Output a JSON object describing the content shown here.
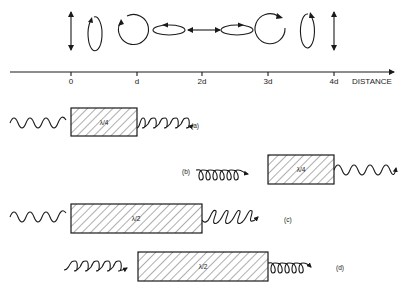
{
  "axis": {
    "label": "DISTANCE",
    "ticks": [
      "0",
      "d",
      "2d",
      "3d",
      "4d"
    ]
  },
  "polarization_states": [
    {
      "at": "0",
      "type": "linear-vertical"
    },
    {
      "at": "0.5d",
      "type": "elliptical-vertical"
    },
    {
      "at": "d",
      "type": "circular"
    },
    {
      "at": "1.5d",
      "type": "elliptical-horizontal"
    },
    {
      "at": "2d",
      "type": "linear-horizontal"
    },
    {
      "at": "2.5d",
      "type": "elliptical-horizontal"
    },
    {
      "at": "3d",
      "type": "circular"
    },
    {
      "at": "3.5d",
      "type": "elliptical-vertical"
    },
    {
      "at": "4d",
      "type": "linear-vertical"
    }
  ],
  "plates": [
    {
      "id": "a",
      "label": "(a)",
      "plate": "λ/4",
      "input": "linear",
      "output": "circular"
    },
    {
      "id": "b",
      "label": "(b)",
      "plate": "λ/4",
      "input": "circular",
      "output": "linear"
    },
    {
      "id": "c",
      "label": "(c)",
      "plate": "λ/2",
      "input": "linear",
      "output": "linear-rotated"
    },
    {
      "id": "d",
      "label": "(d)",
      "plate": "λ/2",
      "input": "circular",
      "output": "circular-reversed"
    }
  ],
  "plate_text": {
    "a": "λ/4",
    "b": "λ/4",
    "c": "λ/2",
    "d": "λ/2"
  }
}
